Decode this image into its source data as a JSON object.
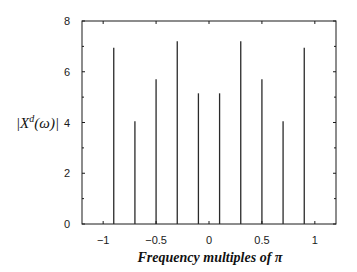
{
  "chart_data": {
    "type": "stem",
    "title": "",
    "xlabel": "Frequency multiples of π",
    "ylabel": "|X^d(ω)|",
    "ylabel_parts": {
      "open": "|X",
      "sup": "d",
      "close": "(ω)|"
    },
    "xlim": [
      -1.2,
      1.2
    ],
    "ylim": [
      0,
      8
    ],
    "grid": false,
    "legend": null,
    "x_ticks": [
      -1,
      -0.5,
      0,
      0.5,
      1
    ],
    "x_tick_labels": [
      "−1",
      "−0.5",
      "0",
      "0.5",
      "1"
    ],
    "x_minor_ticks": [
      -1,
      -0.5,
      0,
      0.5,
      1
    ],
    "y_ticks": [
      0,
      2,
      4,
      6,
      8
    ],
    "y_tick_labels": [
      "0",
      "2",
      "4",
      "6",
      "8"
    ],
    "y_minor_ticks": [
      1,
      3,
      5,
      7
    ],
    "x": [
      -0.9,
      -0.7,
      -0.5,
      -0.3,
      -0.1,
      0.1,
      0.3,
      0.5,
      0.7,
      0.9
    ],
    "values": [
      6.95,
      4.05,
      5.7,
      7.2,
      5.15,
      5.15,
      7.2,
      5.7,
      4.05,
      6.95
    ],
    "colors": {
      "stem": "#2a2a2a",
      "axis": "#1a1a1a",
      "background": "#ffffff"
    }
  }
}
